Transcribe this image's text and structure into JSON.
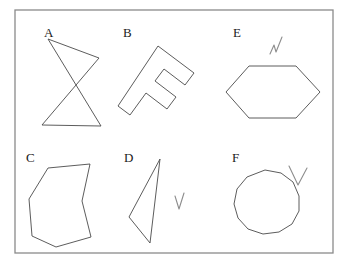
{
  "figure": {
    "background_color": "#ffffff",
    "stroke_color": "#4a4a4a",
    "label_color": "#1a1a1a",
    "mark_color": "#8d8d8d",
    "frame": {
      "name": "outer-border",
      "x": 15,
      "y": 10,
      "width": 318,
      "height": 243,
      "stroke": "#8a8a8a",
      "stroke_width": 1.3
    },
    "panels": [
      {
        "id": "A",
        "label": "A",
        "label_x": 44,
        "label_y": 26,
        "shape_name": "self-intersecting-bowtie-quadrilateral",
        "shape_type": "polygon",
        "closed": true,
        "points": "48,39 99,58 42,125 101,126",
        "marked": false
      },
      {
        "id": "B",
        "label": "B",
        "label_x": 123,
        "label_y": 26,
        "shape_name": "rotated-letter-f-polygon",
        "shape_type": "polygon",
        "closed": true,
        "points": "158,46 194,73 185,85 164,69 155,81 176,97 167,109 146,93 130,115 118,106",
        "marked": false
      },
      {
        "id": "E",
        "label": "E",
        "label_x": 233,
        "label_y": 26,
        "shape_name": "hexagon",
        "shape_type": "polygon",
        "closed": true,
        "points": "249,66 296,66 320,92 296,118 249,118 226,92",
        "marked": true,
        "mark_name": "check-mark",
        "mark_points": "270,54 274,45 276,52 282,37"
      },
      {
        "id": "C",
        "label": "C",
        "label_x": 26,
        "label_y": 151,
        "shape_name": "concave-heptagon",
        "shape_type": "polygon",
        "closed": true,
        "points": "48,168 90,164 82,201 91,237 56,247 32,236 29,199",
        "marked": false
      },
      {
        "id": "D",
        "label": "D",
        "label_x": 124,
        "label_y": 151,
        "shape_name": "thin-triangle",
        "shape_type": "polygon",
        "closed": true,
        "points": "160,159 150,243 129,217",
        "marked": true,
        "mark_name": "check-mark",
        "mark_points": "175,196 179,209 184,193"
      },
      {
        "id": "F",
        "label": "F",
        "label_x": 232,
        "label_y": 151,
        "shape_name": "dodecagon",
        "shape_type": "polygon",
        "closed": true,
        "points": "265,170 281,173 293,182 299,196 299,211 292,224 279,232 263,234 248,229 238,218 234,204 237,189 247,177",
        "marked": true,
        "mark_name": "check-mark",
        "mark_points": "289,166 298,185 307,168"
      }
    ]
  }
}
